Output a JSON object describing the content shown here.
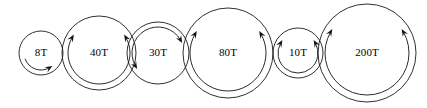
{
  "figure": {
    "width": 427,
    "height": 108,
    "background_color": "#ffffff",
    "line_color": "#1a1a1a",
    "text_color": "#000000"
  },
  "gears": [
    {
      "id": "gear-8t",
      "label": "8T",
      "teeth": 8,
      "cx": 41,
      "cy": 53,
      "r": 22,
      "rotation": "clockwise",
      "arrow_arc_radius": 17,
      "arc_start_deg": 200,
      "arc_end_deg": 300,
      "arrow_count": 1,
      "arrow_at": "end"
    },
    {
      "id": "gear-40t",
      "label": "40T",
      "teeth": 40,
      "cx": 99,
      "cy": 53,
      "r": 37,
      "rotation": "clockwise",
      "arrow_arc_radius": 31,
      "arc_start_deg": 150,
      "arc_end_deg": 390,
      "arrow_count": 2,
      "arrow_at": "both"
    },
    {
      "id": "gear-30t",
      "label": "30T",
      "teeth": 30,
      "cx": 158,
      "cy": 53,
      "r": 31,
      "rotation": "counterclockwise",
      "arrow_arc_radius": 26,
      "arc_start_deg": 30,
      "arc_end_deg": 210,
      "arrow_count": 2,
      "arrow_at": "both"
    },
    {
      "id": "gear-80t",
      "label": "80T",
      "teeth": 80,
      "cx": 228,
      "cy": 53,
      "r": 45,
      "rotation": "clockwise",
      "arrow_arc_radius": 38,
      "arc_start_deg": 150,
      "arc_end_deg": 390,
      "arrow_count": 2,
      "arrow_at": "both"
    },
    {
      "id": "gear-10t",
      "label": "10T",
      "teeth": 10,
      "cx": 298,
      "cy": 53,
      "r": 25,
      "rotation": "clockwise",
      "arrow_arc_radius": 20,
      "arc_start_deg": 150,
      "arc_end_deg": 390,
      "arrow_count": 2,
      "arrow_at": "both"
    },
    {
      "id": "gear-200t",
      "label": "200T",
      "teeth": 200,
      "cx": 367,
      "cy": 53,
      "r": 49,
      "rotation": "clockwise",
      "arrow_arc_radius": 42,
      "arc_start_deg": 150,
      "arc_end_deg": 390,
      "arrow_count": 2,
      "arrow_at": "both"
    }
  ]
}
